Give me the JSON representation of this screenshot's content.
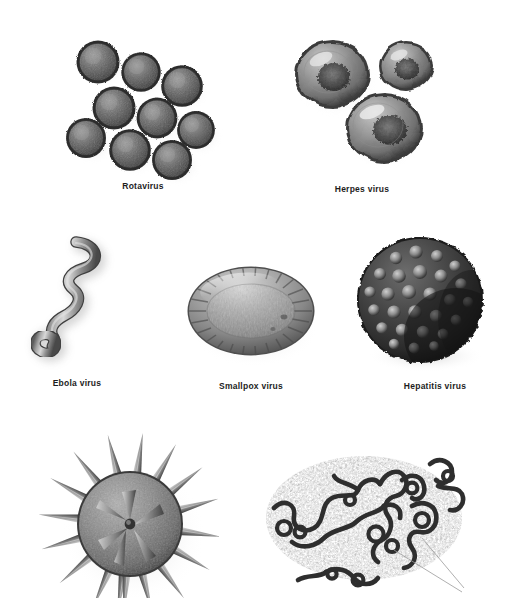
{
  "plate": {
    "title_visible": false,
    "background_color": "#ffffff",
    "rendering": "grayscale airbrush scientific illustration",
    "label_color": "#1d1d1d",
    "rows": [
      {
        "row_index": 1,
        "items": [
          {
            "id": "rotavirus",
            "label": "Rotavirus",
            "label_visible": true,
            "morphology": "cluster of nine small spiky spherical particles",
            "particle_count": 9,
            "shape": "icosahedral with dense short surface spikes",
            "tone": "#5a5a5a"
          },
          {
            "id": "herpes-virus",
            "label": "Herpes virus",
            "label_visible": true,
            "morphology": "three rounded enveloped virions with dark granular cores and glossy highlights",
            "particle_count": 3,
            "shape": "spherical enveloped",
            "tone": "#6e6e6e"
          }
        ]
      },
      {
        "row_index": 2,
        "items": [
          {
            "id": "ebola-virus",
            "label": "Ebola virus",
            "label_visible": true,
            "morphology": "single long filament, hooked at top, zigzag shaft, looped coil at lower left",
            "particle_count": 1,
            "shape": "filamentous shepherd's crook",
            "tone": "#8a8a8a"
          },
          {
            "id": "smallpox-virus",
            "label": "Smallpox virus",
            "label_visible": true,
            "morphology": "brick-shaped oval particle with radial surface striations",
            "particle_count": 1,
            "shape": "ovoid brick",
            "tone": "#7d7d7d"
          },
          {
            "id": "hepatitis-virus",
            "label": "Hepatitis virus",
            "label_visible": true,
            "morphology": "dark sphere covered in rounded capsomere knobs",
            "particle_count": 1,
            "shape": "spherical knobbed capsid",
            "tone": "#3a3a3a"
          }
        ]
      },
      {
        "row_index": 3,
        "items": [
          {
            "id": "spiked-virus",
            "label": "",
            "label_visible": false,
            "cropped_at_bottom": true,
            "morphology": "textured sphere with long conical spikes radiating outward",
            "particle_count": 1,
            "shape": "spherical with long spike projections",
            "tone": "#777777"
          },
          {
            "id": "filamentous-virus-mass",
            "label": "",
            "label_visible": false,
            "cropped_at_bottom": true,
            "morphology": "tangled mass of dark coiled filaments over mottled stippled background with thin leader lines",
            "particle_count": 1,
            "shape": "tangled filament cluster",
            "tone": "#4a4a4a"
          }
        ]
      }
    ]
  }
}
